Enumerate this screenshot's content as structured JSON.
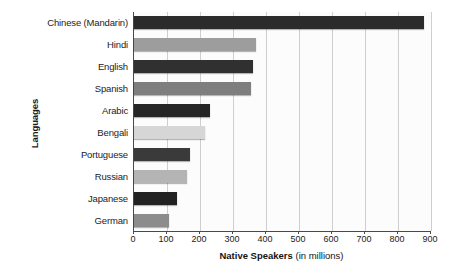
{
  "chart_data": {
    "type": "bar",
    "orientation": "horizontal",
    "title": "",
    "xlabel": "Native Speakers (in millions)",
    "xlabel_bold_part": "Native Speakers",
    "xlabel_light_part": " (in millions)",
    "ylabel": "Languages",
    "categories": [
      "Chinese (Mandarin)",
      "Hindi",
      "English",
      "Spanish",
      "Arabic",
      "Bengali",
      "Portuguese",
      "Russian",
      "Japanese",
      "German"
    ],
    "values": [
      880,
      370,
      360,
      355,
      230,
      215,
      170,
      160,
      130,
      105
    ],
    "bar_colors": [
      "#2b2b2b",
      "#9d9d9d",
      "#303030",
      "#7e7e7e",
      "#262626",
      "#d6d6d6",
      "#3a3a3a",
      "#b4b4b4",
      "#222222",
      "#8c8c8c"
    ],
    "xlim": [
      0,
      900
    ],
    "xticks": [
      0,
      100,
      200,
      300,
      400,
      500,
      600,
      700,
      800,
      900
    ],
    "xtick_labels": [
      "0",
      "100",
      "200",
      "300",
      "400",
      "500",
      "600",
      "700",
      "800",
      "900"
    ],
    "grid": true,
    "grid_axis": "x",
    "legend": false,
    "legend_position": "none",
    "plot_background": "#fcfcfc"
  }
}
